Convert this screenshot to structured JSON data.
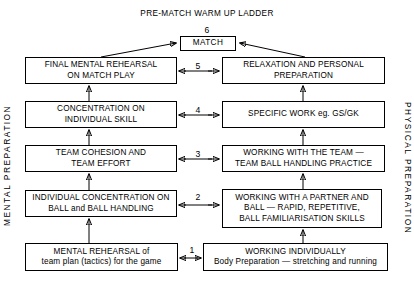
{
  "title": "PRE-MATCH WARM UP LADDER",
  "side_labels": {
    "left": "MENTAL PREPARATION",
    "right": "PHYSICAL PREPARATION"
  },
  "steps": [
    {
      "number": "6",
      "label": "step-6"
    },
    {
      "number": "5",
      "label": "step-5"
    },
    {
      "number": "4",
      "label": "step-4"
    },
    {
      "number": "3",
      "label": "step-3"
    },
    {
      "number": "2",
      "label": "step-2"
    },
    {
      "number": "1",
      "label": "step-1"
    }
  ],
  "match_box": {
    "text": "MATCH"
  },
  "rows": [
    {
      "step": "5",
      "mental": {
        "line1": "FINAL MENTAL REHEARSAL",
        "line2": "ON MATCH PLAY"
      },
      "physical": {
        "line1": "RELAXATION AND PERSONAL",
        "line2": "PREPARATION"
      }
    },
    {
      "step": "4",
      "mental": {
        "line1": "CONCENTRATION ON",
        "line2": "INDIVIDUAL SKILL"
      },
      "physical": {
        "line1": "SPECIFIC WORK eg. GS/GK",
        "line2": ""
      }
    },
    {
      "step": "3",
      "mental": {
        "line1": "TEAM COHESION AND",
        "line2": "TEAM EFFORT"
      },
      "physical": {
        "line1": "WORKING WITH THE TEAM —",
        "line2": "TEAM BALL HANDLING PRACTICE"
      }
    },
    {
      "step": "2",
      "mental": {
        "line1": "INDIVIDUAL CONCENTRATION ON",
        "line2": "BALL and BALL HANDLING"
      },
      "physical": {
        "line1": "WORKING WITH A PARTNER AND",
        "line2": "BALL — RAPID, REPETITIVE,",
        "line3": "BALL FAMILIARISATION SKILLS"
      }
    },
    {
      "step": "1",
      "mental": {
        "line1": "MENTAL REHEARSAL of",
        "line2": "team plan (tactics) for the game"
      },
      "physical": {
        "line1": "WORKING INDIVIDUALLY",
        "line2": "Body Preparation — stretching and running"
      }
    }
  ],
  "colors": {
    "background": "#ffffff",
    "ink": "#000000",
    "box_border": "#000000"
  }
}
